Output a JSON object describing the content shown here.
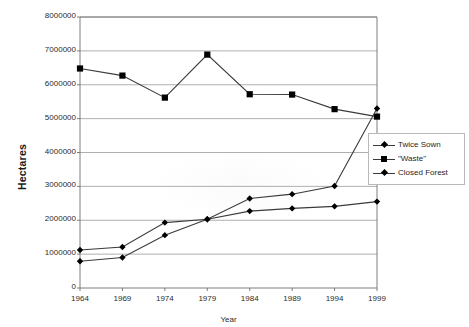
{
  "chart_data": {
    "type": "line",
    "title": "",
    "xlabel": "Year",
    "ylabel": "Hectares",
    "categories": [
      "1964",
      "1969",
      "1974",
      "1979",
      "1984",
      "1989",
      "1994",
      "1999"
    ],
    "x": [
      1964,
      1969,
      1974,
      1979,
      1984,
      1989,
      1994,
      1999
    ],
    "xlim": [
      1964,
      1999
    ],
    "ylim": [
      0,
      8000000
    ],
    "ytick_labels": [
      "8000000",
      "7000000",
      "6000000",
      "5000000",
      "4000000",
      "3000000",
      "2000000",
      "1000000",
      "0"
    ],
    "ytick_values": [
      8000000,
      7000000,
      6000000,
      5000000,
      4000000,
      3000000,
      2000000,
      1000000,
      0
    ],
    "grid": true,
    "grid_axis": "y",
    "legend_position": "right",
    "series": [
      {
        "name": "Twice Sown",
        "marker": "diamond",
        "color": "#000000",
        "values": [
          790000,
          900000,
          1560000,
          2030000,
          2270000,
          2350000,
          2410000,
          2550000
        ]
      },
      {
        "name": "\"Waste\"",
        "marker": "square",
        "color": "#000000",
        "values": [
          6480000,
          6270000,
          5620000,
          6890000,
          5720000,
          5710000,
          5280000,
          5060000
        ]
      },
      {
        "name": "Closed Forest",
        "marker": "diamond",
        "color": "#000000",
        "values": [
          1120000,
          1210000,
          1930000,
          2030000,
          2640000,
          2770000,
          3010000,
          5300000
        ]
      }
    ],
    "colors": {
      "line": "#3a3a3a",
      "marker": "#000000",
      "grid": "#9a9a9a",
      "axis": "#6f6f6f",
      "text": "#2b2b2b",
      "background": "#ffffff",
      "legend_border": "#b9b9b9"
    }
  },
  "legend": {
    "items": [
      {
        "label": "Twice Sown",
        "marker": "diamond"
      },
      {
        "label": "\"Waste\"",
        "marker": "square"
      },
      {
        "label": "Closed Forest",
        "marker": "diamond"
      }
    ]
  },
  "axes": {
    "y_title": "Hectares",
    "x_title": "Year"
  }
}
